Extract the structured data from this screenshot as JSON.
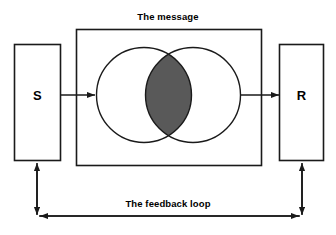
{
  "diagram": {
    "title": "The message",
    "feedback_label": "The feedback loop",
    "sender": {
      "label": "S",
      "name": "sender-box"
    },
    "receiver": {
      "label": "R",
      "name": "receiver-box"
    },
    "venn": {
      "left_circle_name": "sender-field-of-experience-circle",
      "right_circle_name": "receiver-field-of-experience-circle",
      "overlap_name": "shared-field-of-experience-lens",
      "overlap_fill": "#595959"
    },
    "arrows": {
      "sender_to_message": "arrow-sender-to-message",
      "message_to_receiver": "arrow-message-to-receiver",
      "feedback_left": "feedback-arrow-left",
      "feedback_right": "feedback-arrow-right",
      "feedback_up_into_sender": "feedback-arrow-up-into-sender",
      "feedback_down_from_receiver": "feedback-arrow-down-from-receiver"
    },
    "colors": {
      "stroke": "#1a1a1a",
      "background": "#ffffff",
      "overlap": "#595959"
    }
  }
}
